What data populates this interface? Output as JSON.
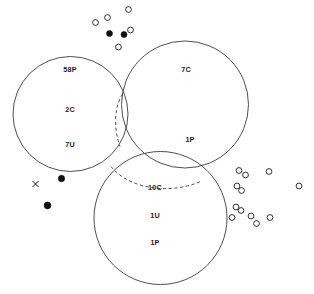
{
  "figure": {
    "width": 314,
    "height": 294,
    "background_color": "#ffffff",
    "stroke_color": "#3a3a3a",
    "marker_color": "#101010",
    "label_color": "#1c1c1c"
  },
  "circles": [
    {
      "id": "left-circle",
      "name": "left-circle",
      "cx": 70.5,
      "cy": 114.0,
      "r": 57.5
    },
    {
      "id": "right-circle",
      "name": "right-circle",
      "cx": 185.0,
      "cy": 104.5,
      "r": 63.5
    },
    {
      "id": "bottom-circle",
      "name": "bottom-circle",
      "cx": 160.5,
      "cy": 218.0,
      "r": 66.5
    }
  ],
  "dashed_arcs": [
    {
      "id": "left-right-lens-arc",
      "name": "dashed-arc-left-right",
      "path": "M 122.5 94.0 C 114.0 108.0 113.5 128.0 120.0 146.5"
    },
    {
      "id": "bottom-top-arc",
      "name": "dashed-arc-bottom-top",
      "path": "M 111.0 166.5 C 128.0 188.0 168.0 195.5 200.5 181.5"
    }
  ],
  "region_labels": [
    {
      "id": "lbl-58p",
      "text": "58P",
      "x": 70,
      "y": 70,
      "circle": "left-circle"
    },
    {
      "id": "lbl-2c",
      "text": "2C",
      "x": 70,
      "y": 110,
      "circle": "left-circle"
    },
    {
      "id": "lbl-7u",
      "text": "7U",
      "x": 70,
      "y": 145,
      "circle": "left-circle"
    },
    {
      "id": "lbl-7c",
      "text": "7C",
      "x": 186,
      "y": 70,
      "circle": "right-circle"
    },
    {
      "id": "lbl-1p-right",
      "text": "1P",
      "x": 190,
      "y": 140,
      "circle": "right-circle"
    },
    {
      "id": "lbl-10c",
      "text": "10C",
      "x": 155,
      "y": 188,
      "circle": "bottom-circle"
    },
    {
      "id": "lbl-1u",
      "text": "1U",
      "x": 155,
      "y": 216,
      "circle": "bottom-circle"
    },
    {
      "id": "lbl-1p-bottom",
      "text": "1P",
      "x": 155,
      "y": 243,
      "circle": "bottom-circle"
    }
  ],
  "markers": {
    "top_cluster": [
      {
        "type": "open",
        "x": 128.5,
        "y": 9.5,
        "r": 2.9
      },
      {
        "type": "open",
        "x": 107.5,
        "y": 17.5,
        "r": 2.9
      },
      {
        "type": "open",
        "x": 95.5,
        "y": 22.5,
        "r": 2.9
      },
      {
        "type": "filled",
        "x": 109.5,
        "y": 33.5,
        "r": 3.0
      },
      {
        "type": "filled",
        "x": 124.0,
        "y": 34.5,
        "r": 3.0
      },
      {
        "type": "open",
        "x": 130.5,
        "y": 30.0,
        "r": 2.9
      },
      {
        "type": "open",
        "x": 118.5,
        "y": 47.0,
        "r": 2.9
      }
    ],
    "left_cluster": [
      {
        "type": "cross",
        "x": 35.5,
        "y": 184.0,
        "r": 3.0
      },
      {
        "type": "filled",
        "x": 61.5,
        "y": 178.5,
        "r": 3.2
      },
      {
        "type": "filled",
        "x": 47.5,
        "y": 205.5,
        "r": 3.4
      }
    ],
    "right_cluster": [
      {
        "type": "open",
        "x": 239.0,
        "y": 170.5,
        "r": 2.9
      },
      {
        "type": "open",
        "x": 245.5,
        "y": 175.0,
        "r": 2.9
      },
      {
        "type": "open",
        "x": 269.0,
        "y": 171.5,
        "r": 2.9
      },
      {
        "type": "open",
        "x": 237.0,
        "y": 186.0,
        "r": 2.9
      },
      {
        "type": "open",
        "x": 241.5,
        "y": 190.5,
        "r": 2.9
      },
      {
        "type": "open",
        "x": 299.0,
        "y": 186.0,
        "r": 2.9
      },
      {
        "type": "open",
        "x": 236.0,
        "y": 207.0,
        "r": 2.9
      },
      {
        "type": "open",
        "x": 241.0,
        "y": 210.5,
        "r": 2.9
      },
      {
        "type": "open",
        "x": 232.0,
        "y": 217.5,
        "r": 2.9
      },
      {
        "type": "open",
        "x": 251.0,
        "y": 216.0,
        "r": 2.9
      },
      {
        "type": "open",
        "x": 256.5,
        "y": 223.5,
        "r": 2.9
      },
      {
        "type": "open",
        "x": 270.0,
        "y": 217.5,
        "r": 2.9
      }
    ]
  }
}
